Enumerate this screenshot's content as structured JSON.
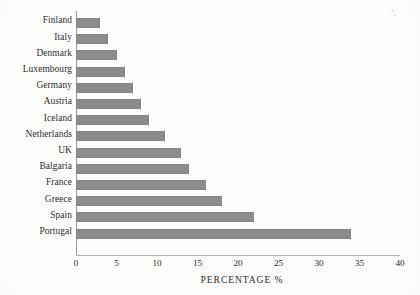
{
  "chart_data": {
    "type": "bar",
    "orientation": "horizontal",
    "title": "",
    "xlabel": "PERCENTAGE %",
    "ylabel": "",
    "categories": [
      "Finland",
      "Italy",
      "Denmark",
      "Luxembourg",
      "Germany",
      "Austria",
      "Iceland",
      "Netherlands",
      "UK",
      "Balgaria",
      "France",
      "Greece",
      "Spain",
      "Portugal"
    ],
    "values": [
      3,
      4,
      5,
      6,
      7,
      8,
      9,
      11,
      13,
      14,
      16,
      18,
      22,
      34
    ],
    "xlim": [
      0,
      40
    ],
    "xticks": [
      0,
      5,
      10,
      15,
      20,
      25,
      30,
      35,
      40
    ],
    "xtick_labels": [
      "0",
      "5",
      "10",
      "15",
      "20",
      "25",
      "30",
      "35",
      "40"
    ],
    "grid": false,
    "legend": null,
    "bar_color": "#8c8c8c",
    "axis_color": "#9b9b9b",
    "text_color": "#2b2b2b"
  },
  "artifacts": {
    "speck_label": "scan-speck"
  }
}
